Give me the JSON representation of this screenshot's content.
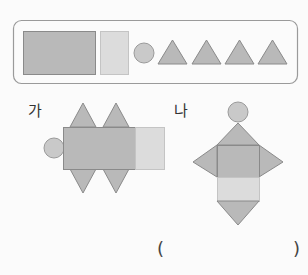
{
  "header": {
    "cut_text": "···  ·  ·—  ·"
  },
  "figures": {
    "ga": {
      "label": "가"
    },
    "na": {
      "label": "나"
    }
  },
  "answer": {
    "open": "(",
    "close": ")"
  },
  "colors": {
    "dark_fill": "#b9b9b9",
    "light_fill": "#dcdcdc",
    "stroke": "#8a8a8a",
    "box_stroke": "#9a9a9a"
  }
}
